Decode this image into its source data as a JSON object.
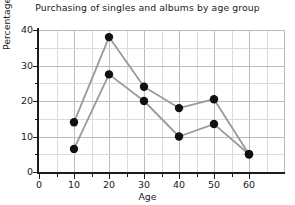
{
  "chart_data": {
    "type": "line",
    "title": "Purchasing of singles and albums by age group",
    "xlabel": "Age",
    "ylabel": "Percentage of sales",
    "x": [
      10,
      20,
      30,
      40,
      50,
      60
    ],
    "xlim": [
      0,
      70
    ],
    "ylim": [
      0,
      40
    ],
    "xticks": [
      "0",
      "10",
      "20",
      "30",
      "40",
      "50",
      "60"
    ],
    "xtick_values": [
      0,
      10,
      20,
      30,
      40,
      50,
      60
    ],
    "yticks": [
      "0",
      "10",
      "20",
      "30",
      "40"
    ],
    "ytick_values": [
      0,
      10,
      20,
      30,
      40
    ],
    "grid": true,
    "grid_minor": true,
    "legend": "none",
    "marker": "filled-circle",
    "series": [
      {
        "name": "series-upper",
        "values": [
          14,
          38,
          24,
          18,
          20.5,
          5
        ]
      },
      {
        "name": "series-lower",
        "values": [
          6.5,
          27.5,
          20,
          10,
          13.5,
          5
        ]
      }
    ],
    "colors": {
      "line": "#9a9a9a",
      "marker": "#111111",
      "grid_major": "#bcbcbc",
      "grid_minor": "#dcdcdc",
      "axis": "#1c1c1c",
      "text": "#1a1a1a",
      "background": "#ffffff"
    }
  }
}
